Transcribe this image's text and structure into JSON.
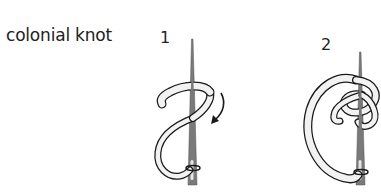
{
  "diagram": {
    "title": "colonial knot",
    "steps": [
      {
        "number": "1",
        "description": "ribbon wrapped in figure-eight around needle, arrow showing wrap direction"
      },
      {
        "number": "2",
        "description": "ribbon loop completed around needle forming knot"
      }
    ],
    "colors": {
      "needle": "#7a7a7a",
      "ribbon_fill": "#f2f2f2",
      "outline": "#1a1a1a",
      "text": "#222222"
    }
  }
}
